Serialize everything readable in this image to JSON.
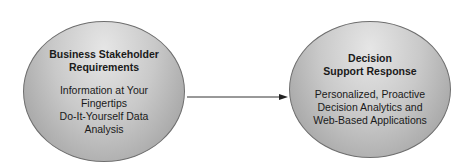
{
  "nodes": {
    "left": {
      "title": [
        "Business Stakeholder",
        "Requirements"
      ],
      "body": [
        "Information at Your",
        "Fingertips",
        "Do-It-Yourself Data",
        "Analysis"
      ]
    },
    "right": {
      "title": [
        "Decision",
        "Support Response"
      ],
      "body": [
        "Personalized, Proactive",
        "Decision Analytics and",
        "Web-Based Applications"
      ]
    }
  },
  "edges": [
    {
      "from": "left",
      "to": "right",
      "type": "arrow"
    }
  ]
}
